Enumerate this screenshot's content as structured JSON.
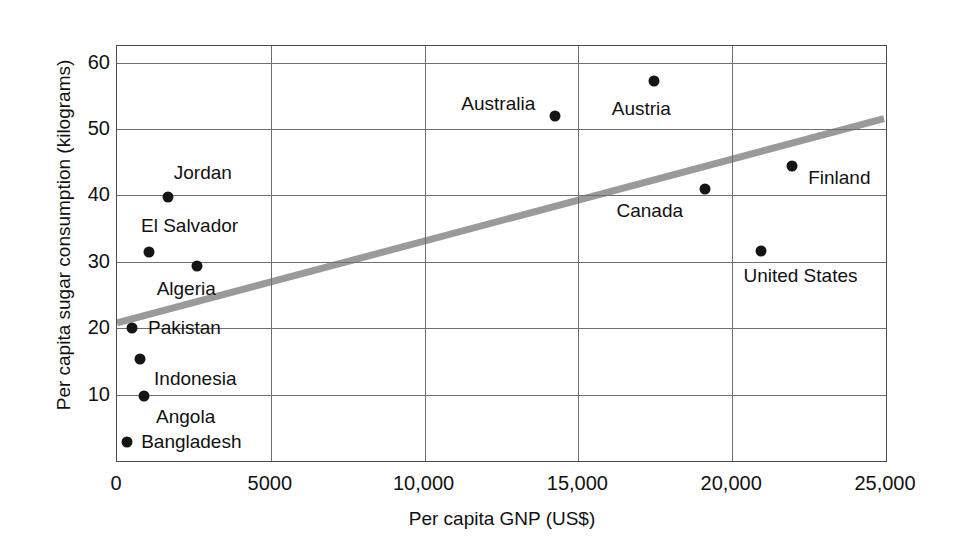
{
  "chart_data": {
    "type": "scatter",
    "title": "",
    "xlabel": "Per capita GNP (US$)",
    "ylabel": "Per capita sugar consumption (kilograms)",
    "xlim": [
      0,
      25000
    ],
    "ylim": [
      0,
      62.5
    ],
    "grid": true,
    "legend": "none",
    "xticks": [
      {
        "value": 0,
        "label": "0"
      },
      {
        "value": 5000,
        "label": "5000"
      },
      {
        "value": 10000,
        "label": "10,000"
      },
      {
        "value": 15000,
        "label": "15,000"
      },
      {
        "value": 20000,
        "label": "20,000"
      },
      {
        "value": 25000,
        "label": "25,000"
      }
    ],
    "yticks": [
      {
        "value": 10,
        "label": "10"
      },
      {
        "value": 20,
        "label": "20"
      },
      {
        "value": 30,
        "label": "30"
      },
      {
        "value": 40,
        "label": "40"
      },
      {
        "value": 50,
        "label": "50"
      },
      {
        "value": 60,
        "label": "60"
      }
    ],
    "point_color": "#151515",
    "trendline_color": "#9a9a9a",
    "trendline": {
      "x0": 0,
      "y0": 20.6,
      "x1": 25000,
      "y1": 51.5
    },
    "points": [
      {
        "name": "Bangladesh",
        "x": 330,
        "y": 2.8,
        "label_dx": 14,
        "label_dy": 0
      },
      {
        "name": "Angola",
        "x": 880,
        "y": 9.8,
        "label_dx": 12,
        "label_dy": 21
      },
      {
        "name": "Indonesia",
        "x": 750,
        "y": 15.4,
        "label_dx": 14,
        "label_dy": 20
      },
      {
        "name": "Pakistan",
        "x": 490,
        "y": 20.1,
        "label_dx": 16,
        "label_dy": 0
      },
      {
        "name": "El Salvador",
        "x": 1040,
        "y": 31.5,
        "label_dx": -8,
        "label_dy": -26
      },
      {
        "name": "Algeria",
        "x": 2590,
        "y": 29.3,
        "label_dx": -40,
        "label_dy": 23
      },
      {
        "name": "Jordan",
        "x": 1650,
        "y": 39.8,
        "label_dx": 6,
        "label_dy": -24
      },
      {
        "name": "Australia",
        "x": 14250,
        "y": 51.9,
        "label_dx": -94,
        "label_dy": -12
      },
      {
        "name": "Austria",
        "x": 17450,
        "y": 57.3,
        "label_dx": -42,
        "label_dy": 28
      },
      {
        "name": "Canada",
        "x": 19100,
        "y": 41.0,
        "label_dx": -88,
        "label_dy": 22
      },
      {
        "name": "Finland",
        "x": 21950,
        "y": 44.5,
        "label_dx": 16,
        "label_dy": 12
      },
      {
        "name": "United States",
        "x": 20950,
        "y": 31.6,
        "label_dx": -18,
        "label_dy": 25
      }
    ]
  }
}
